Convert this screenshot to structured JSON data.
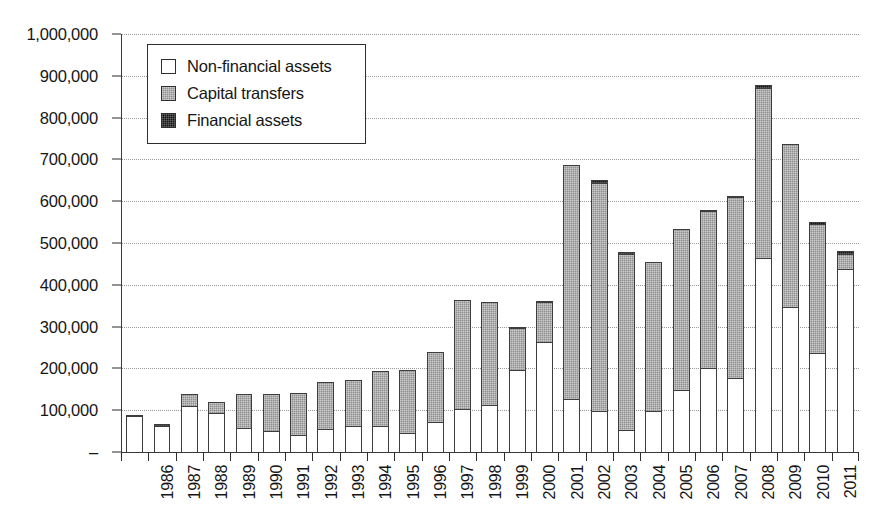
{
  "chart_data": {
    "type": "bar",
    "subtype": "stacked-bar",
    "title": "",
    "subtitle": "",
    "xlabel": "",
    "ylabel": "",
    "grid": true,
    "legend_position": "top-left-inside",
    "ylim": [
      0,
      1000000
    ],
    "ytick_labels": [
      "1,000,000",
      "900,000",
      "800,000",
      "700,000",
      "600,000",
      "500,000",
      "400,000",
      "300,000",
      "200,000",
      "100,000",
      "–"
    ],
    "ytick_values": [
      1000000,
      900000,
      800000,
      700000,
      600000,
      500000,
      400000,
      300000,
      200000,
      100000,
      0
    ],
    "categories": [
      "1986",
      "1987",
      "1988",
      "1989",
      "1990",
      "1991",
      "1992",
      "1993",
      "1994",
      "1995",
      "1996",
      "1997",
      "1998",
      "1999",
      "2000",
      "2001",
      "2002",
      "2003",
      "2004",
      "2005",
      "2006",
      "2007",
      "2008",
      "2009",
      "2010",
      "2011",
      "2012"
    ],
    "series": [
      {
        "name": "Non-financial assets",
        "color": "#ffffff",
        "values": [
          88000,
          65000,
          112000,
          95000,
          60000,
          52000,
          43000,
          58000,
          65000,
          65000,
          48000,
          75000,
          105000,
          115000,
          198000,
          265000,
          130000,
          102000,
          55000,
          100000,
          152000,
          205000,
          180000,
          468000,
          350000,
          240000,
          440000
        ]
      },
      {
        "name": "Capital transfers",
        "color": "#8e8e8e",
        "values": [
          0,
          0,
          33000,
          30000,
          85000,
          93000,
          103000,
          115000,
          112000,
          135000,
          155000,
          170000,
          265000,
          250000,
          105000,
          100000,
          562000,
          548000,
          425000,
          360000,
          388000,
          378000,
          435000,
          408000,
          392000,
          310000,
          40000
        ]
      },
      {
        "name": "Financial assets",
        "color": "#161616",
        "values": [
          7000,
          7000,
          0,
          0,
          0,
          0,
          0,
          0,
          0,
          0,
          0,
          0,
          0,
          0,
          5000,
          5000,
          0,
          10000,
          7000,
          0,
          0,
          5000,
          5000,
          10000,
          0,
          10000,
          10000
        ]
      }
    ],
    "totals": [
      95000,
      72000,
      145000,
      125000,
      145000,
      145000,
      146000,
      173000,
      177000,
      200000,
      203000,
      245000,
      370000,
      365000,
      308000,
      370000,
      692000,
      660000,
      487000,
      460000,
      540000,
      588000,
      620000,
      886000,
      742000,
      560000,
      490000
    ]
  },
  "legend": {
    "items": [
      {
        "label": "Non-financial assets",
        "swatch": "nonfin"
      },
      {
        "label": "Capital transfers",
        "swatch": "capital"
      },
      {
        "label": "Financial assets",
        "swatch": "fin"
      }
    ]
  }
}
